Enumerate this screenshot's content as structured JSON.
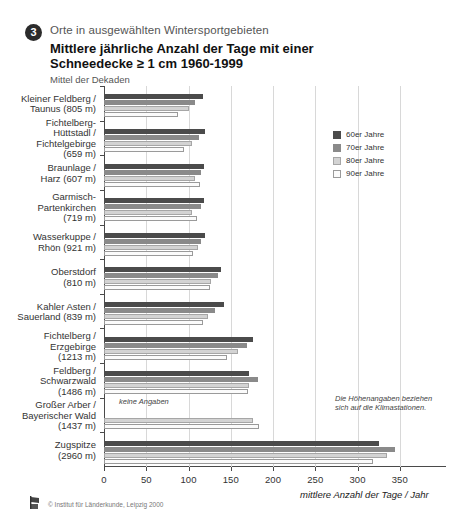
{
  "header": {
    "number": "3",
    "kicker": "Orte in ausgewählten Wintersportgebieten",
    "title_line1": "Mittlere jährliche Anzahl der Tage mit einer",
    "title_line2": "Schneedecke ≥ 1 cm 1960-1999",
    "subtitle": "Mittel der Dekaden"
  },
  "legend": {
    "position": "top-right",
    "items": [
      {
        "label": "60er Jahre",
        "color": "#4b4b4b"
      },
      {
        "label": "70er Jahre",
        "color": "#8a8a8a"
      },
      {
        "label": "80er Jahre",
        "color": "#d3d3d3"
      },
      {
        "label": "90er Jahre",
        "color": "#fbfbfb"
      }
    ]
  },
  "annotations": {
    "keine_angaben": "keine Angaben",
    "height_note": "Die Höhenangaben beziehen sich auf die Klimastationen."
  },
  "footer": {
    "copyright": "© Institut für Länderkunde, Leipzig 2000"
  },
  "chart_data": {
    "type": "bar",
    "orientation": "horizontal",
    "title": "Mittlere jährliche Anzahl der Tage mit einer Schneedecke ≥ 1 cm 1960-1999",
    "subtitle": "Mittel der Dekaden",
    "xlabel": "mittlere Anzahl der Tage / Jahr",
    "ylabel": "",
    "xlim": [
      0,
      400
    ],
    "xticks": [
      0,
      50,
      100,
      150,
      200,
      250,
      300,
      350
    ],
    "xticklabels": [
      "0",
      "50",
      "100",
      "150",
      "200",
      "250",
      "300",
      "350"
    ],
    "grid": "vertical",
    "categories": [
      "Kleiner Feldberg / Taunus (805 m)",
      "Fichtelberg-Hüttstadl / Fichtelgebirge (659 m)",
      "Braunlage / Harz (607 m)",
      "Garmisch-Partenkirchen (719 m)",
      "Wasserkuppe / Rhön (921 m)",
      "Oberstdorf (810 m)",
      "Kahler Asten / Sauerland (839 m)",
      "Fichtelberg / Erzgebirge (1213 m)",
      "Feldberg / Schwarzwald (1486 m)",
      "Großer Arber / Bayerischer Wald (1437 m)",
      "Zugspitze (2960 m)"
    ],
    "category_labels": [
      [
        "Kleiner Feldberg /",
        "Taunus (805 m)"
      ],
      [
        "Fichtelberg-",
        "Hüttstadl /",
        "Fichtelgebirge",
        "(659 m)"
      ],
      [
        "Braunlage /",
        "Harz (607 m)"
      ],
      [
        "Garmisch-",
        "Partenkirchen",
        "(719 m)"
      ],
      [
        "Wasserkuppe /",
        "Rhön (921 m)"
      ],
      [
        "Oberstdorf",
        "(810 m)"
      ],
      [
        "Kahler Asten /",
        "Sauerland (839 m)"
      ],
      [
        "Fichtelberg /",
        "Erzgebirge",
        "(1213 m)"
      ],
      [
        "Feldberg /",
        "Schwarzwald",
        "(1486 m)"
      ],
      [
        "Großer Arber /",
        "Bayerischer Wald",
        "(1437 m)"
      ],
      [
        "Zugspitze",
        "(2960 m)"
      ]
    ],
    "series": [
      {
        "name": "60er Jahre",
        "color": "#4b4b4b",
        "values": [
          117,
          119,
          118,
          118,
          119,
          139,
          142,
          176,
          172,
          null,
          325
        ]
      },
      {
        "name": "70er Jahre",
        "color": "#8a8a8a",
        "values": [
          108,
          113,
          115,
          115,
          115,
          135,
          131,
          169,
          182,
          null,
          344
        ]
      },
      {
        "name": "80er Jahre",
        "color": "#d3d3d3",
        "values": [
          101,
          104,
          108,
          104,
          111,
          127,
          123,
          158,
          172,
          176,
          335
        ]
      },
      {
        "name": "90er Jahre",
        "color": "#fbfbfb",
        "values": [
          87,
          95,
          114,
          110,
          105,
          125,
          117,
          145,
          170,
          184,
          318
        ]
      }
    ]
  }
}
